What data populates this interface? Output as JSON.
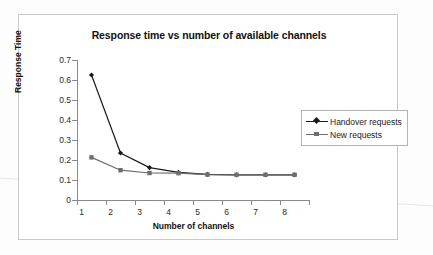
{
  "chart_data": {
    "type": "line",
    "title": "Response time vs number of available channels",
    "xlabel": "Number of channels",
    "ylabel": "Response Time",
    "categories": [
      1,
      2,
      3,
      4,
      5,
      6,
      7,
      8
    ],
    "x_tick_labels": [
      "1",
      "2",
      "3",
      "4",
      "5",
      "6",
      "7",
      "8"
    ],
    "y_tick_labels": [
      "0",
      "0.1",
      "0.2",
      "0.3",
      "0.4",
      "0.5",
      "0.6",
      "0.7"
    ],
    "y_tick_values": [
      0,
      0.1,
      0.2,
      0.3,
      0.4,
      0.5,
      0.6,
      0.7
    ],
    "ylim": [
      0,
      0.7
    ],
    "grid": false,
    "legend_position": "right-inside",
    "series": [
      {
        "name": "Handover requests",
        "color": "#1a1a1a",
        "marker": "diamond",
        "values": [
          0.625,
          0.235,
          0.162,
          0.138,
          0.128,
          0.126,
          0.126,
          0.126
        ]
      },
      {
        "name": "New requests",
        "color": "#6e6e6e",
        "marker": "square",
        "values": [
          0.213,
          0.149,
          0.135,
          0.134,
          0.127,
          0.126,
          0.126,
          0.126
        ]
      }
    ]
  },
  "legend": {
    "items": [
      {
        "label": "Handover requests"
      },
      {
        "label": "New requests"
      }
    ]
  },
  "colors": {
    "frame": "#c9c9c9",
    "axis": "#8a8a8a",
    "series1": "#1a1a1a",
    "series2": "#6e6e6e",
    "text": "#111111",
    "background": "#ffffff"
  }
}
